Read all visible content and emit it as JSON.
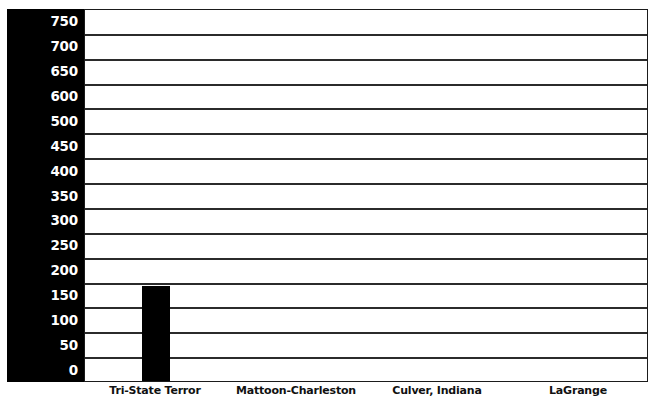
{
  "chart_data": {
    "type": "bar",
    "title": "",
    "subtitle": "",
    "xlabel": "",
    "ylabel": "",
    "categories": [
      "Tri-State Terror",
      "Mattoon-Charleston",
      "Culver, Indiana",
      "LaGrange"
    ],
    "values": [
      205,
      0,
      0,
      0
    ],
    "ylim": [
      0,
      775
    ],
    "ytick_labels": [
      "750",
      "700",
      "650",
      "600",
      "500",
      "450",
      "400",
      "350",
      "300",
      "250",
      "200",
      "150",
      "100",
      "50",
      "0"
    ],
    "ytick_values": [
      750,
      700,
      650,
      600,
      500,
      450,
      400,
      350,
      300,
      250,
      200,
      150,
      100,
      50,
      0
    ],
    "grid": true,
    "grid_axis": "y",
    "legend": false,
    "legend_position": "none",
    "series": [
      {
        "name": "Fatalities",
        "values": [
          205,
          0,
          0,
          0
        ]
      }
    ],
    "annotations": []
  },
  "style": {
    "bar_color": "#000000",
    "axis_panel_color": "#000000",
    "axis_label_color": "#ffffff",
    "plot_background": "#ffffff",
    "gridline_color": "#2b2b2b",
    "frame_color": "#1b1b1b",
    "category_label_color": "#111111"
  }
}
